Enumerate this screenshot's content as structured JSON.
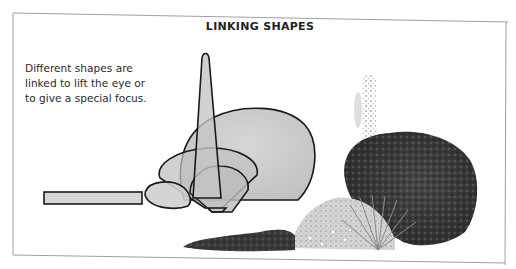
{
  "illustration": {
    "title": "LINKING SHAPES",
    "caption": "Different shapes are linked to lift the eye or to give a special focus.",
    "shapes": [
      {
        "name": "horizontal-bar",
        "kind": "rectangle"
      },
      {
        "name": "small-mound",
        "kind": "oval"
      },
      {
        "name": "wide-fan",
        "kind": "fan"
      },
      {
        "name": "small-fan",
        "kind": "fan"
      },
      {
        "name": "large-mound",
        "kind": "rounded-blob"
      },
      {
        "name": "spire",
        "kind": "narrow-cone"
      }
    ],
    "plants": [
      {
        "name": "low-groundcover"
      },
      {
        "name": "flowering-mound"
      },
      {
        "name": "grass-fan"
      },
      {
        "name": "tall-spike"
      },
      {
        "name": "large-shrub"
      }
    ],
    "colors": {
      "shape_fill": "#c9c9c9",
      "shape_stroke": "#1a1a1a",
      "frame": "#9a9a9a",
      "shrub_dark": "#3c3c3c",
      "plant_light": "#bdbdbd"
    }
  }
}
